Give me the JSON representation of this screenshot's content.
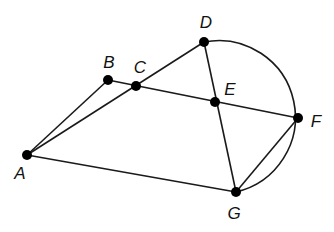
{
  "diagram": {
    "stroke_color": "#1a1a1a",
    "points": [
      {
        "id": "A",
        "label": "A",
        "x": 27,
        "y": 155,
        "lx": 20,
        "ly": 173
      },
      {
        "id": "B",
        "label": "B",
        "x": 108,
        "y": 80,
        "lx": 109,
        "ly": 62
      },
      {
        "id": "C",
        "label": "C",
        "x": 136,
        "y": 86,
        "lx": 140,
        "ly": 67
      },
      {
        "id": "D",
        "label": "D",
        "x": 204,
        "y": 42,
        "lx": 206,
        "ly": 22
      },
      {
        "id": "E",
        "label": "E",
        "x": 215,
        "y": 102,
        "lx": 230,
        "ly": 89
      },
      {
        "id": "F",
        "label": "F",
        "x": 298,
        "y": 118,
        "lx": 316,
        "ly": 121
      },
      {
        "id": "G",
        "label": "G",
        "x": 236,
        "y": 192,
        "lx": 234,
        "ly": 213
      }
    ],
    "segments": [
      [
        "A",
        "B"
      ],
      [
        "A",
        "D"
      ],
      [
        "A",
        "G"
      ],
      [
        "B",
        "F"
      ],
      [
        "D",
        "G"
      ],
      [
        "G",
        "F"
      ]
    ],
    "arc": {
      "from": "D",
      "to": "G",
      "through": "F"
    }
  }
}
